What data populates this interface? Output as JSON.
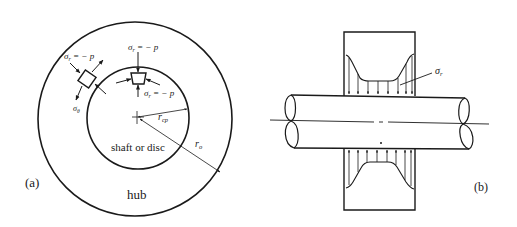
{
  "panel_a": {
    "label": "(a)",
    "hub_label": "hub",
    "shaft_label": "shaft or disc",
    "stress_radial_top": "σr = − p",
    "stress_radial_top_sym": "σ",
    "stress_radial_top_sub": "r",
    "stress_radial_top_rhs": " = − p",
    "stress_radial_left_sym": "σ",
    "stress_radial_left_sub": "r",
    "stress_radial_left_rhs": " = − p",
    "stress_radial_inner_sym": "σ",
    "stress_radial_inner_sub": "r",
    "stress_radial_inner_rhs": " = − p",
    "stress_hoop_sym": "σ",
    "stress_hoop_sub": "θ",
    "radius_inner_sym": "r",
    "radius_inner_sub": "cp",
    "radius_outer_sym": "r",
    "radius_outer_sub": "o"
  },
  "panel_b": {
    "label": "(b)",
    "stress_sym": "σ",
    "stress_sub": "r"
  },
  "colors": {
    "line": "#1a1a1a",
    "background": "#ffffff"
  }
}
